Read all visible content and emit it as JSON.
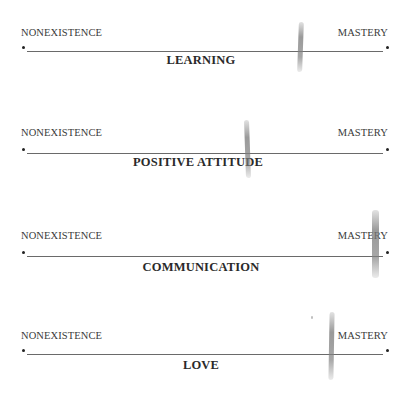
{
  "scales": [
    {
      "title": "LEARNING",
      "left_label": "NONEXISTENCE",
      "right_label": "MASTERY",
      "mark_position_pct": 76
    },
    {
      "title": "POSITIVE ATTITUDE",
      "left_label": "NONEXISTENCE",
      "right_label": "MASTERY",
      "mark_position_pct": 61
    },
    {
      "title": "COMMUNICATION",
      "left_label": "NONEXISTENCE",
      "right_label": "MASTERY",
      "mark_position_pct": 97
    },
    {
      "title": "LOVE",
      "left_label": "NONEXISTENCE",
      "right_label": "MASTERY",
      "mark_position_pct": 85
    }
  ],
  "colors": {
    "text": "#333333",
    "line": "#6a6a6a",
    "mark": "#8c8c8c"
  }
}
